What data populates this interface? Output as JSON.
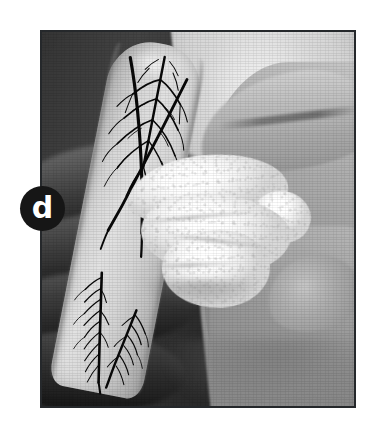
{
  "figure": {
    "panel_label": "d",
    "label_badge_color": "#161616",
    "label_text_color": "#ffffff",
    "background_color": "#ffffff",
    "photo_border_color": "#25282b",
    "rendering": "grayscale halftone print",
    "caption": ""
  },
  "photo": {
    "subject": "gloved hand holding an elongated rounded specimen slab wrapped with white gauze",
    "color_mode": "black-and-white",
    "elements": {
      "specimen": "elongated rounded slab with dark dendritic branching pattern",
      "gauze": "white textured cotton gauze wrapped around the slab midsection",
      "left_hand": "dark shadowed fingers gripping from the lower left",
      "right_hand": "lighter hand and thumb supporting from the upper right",
      "background": "plain light gray studio backdrop"
    },
    "dendrite_regions": [
      {
        "name": "upper-dendrite",
        "position": "top of slab"
      },
      {
        "name": "lower-dendrite",
        "position": "bottom of slab"
      }
    ]
  }
}
